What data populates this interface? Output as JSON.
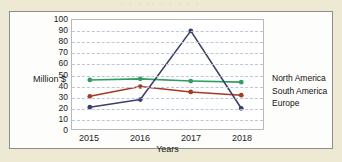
{
  "figure": {
    "scan_artifact_text": "· ·   ·  ·· · ·   ·    ·  ·",
    "background_color": "#eee9d2",
    "panel_color": "#fdfdfb",
    "border_color": "#8d8d8d"
  },
  "chart_data": {
    "type": "line",
    "title": "",
    "xlabel": "Years",
    "ylabel": "Million $",
    "categories": [
      "2015",
      "2016",
      "2017",
      "2018"
    ],
    "ylim": [
      0,
      100
    ],
    "yticks": [
      0,
      10,
      20,
      30,
      40,
      50,
      60,
      70,
      80,
      90,
      100
    ],
    "grid": true,
    "grid_axis": "y",
    "grid_style": "dashed",
    "grid_color": "#b9c6dd",
    "legend_position": "right",
    "series": [
      {
        "name": "North America",
        "color": "#2f9e5e",
        "values": [
          45,
          46,
          44,
          43
        ]
      },
      {
        "name": "South America",
        "color": "#a83a20",
        "values": [
          30,
          39,
          34,
          31
        ]
      },
      {
        "name": "Europe",
        "color": "#3b3f6b",
        "values": [
          20,
          27,
          90,
          19
        ]
      }
    ]
  }
}
